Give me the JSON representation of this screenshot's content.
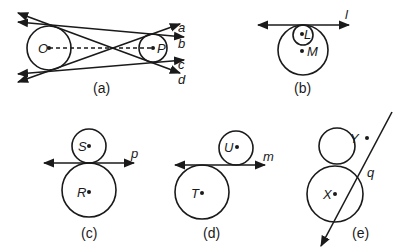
{
  "figures": {
    "a": {
      "caption": "(a)",
      "circles": [
        {
          "name": "O"
        },
        {
          "name": "P"
        }
      ],
      "lines": [
        "a",
        "b",
        "c",
        "d"
      ],
      "segment": "OP (dashed)"
    },
    "b": {
      "caption": "(b)",
      "circles": [
        {
          "name": "L"
        },
        {
          "name": "M"
        }
      ],
      "lines": [
        "l"
      ]
    },
    "c": {
      "caption": "(c)",
      "circles": [
        {
          "name": "S"
        },
        {
          "name": "R"
        }
      ],
      "lines": [
        "p"
      ]
    },
    "d": {
      "caption": "(d)",
      "circles": [
        {
          "name": "U"
        },
        {
          "name": "T"
        }
      ],
      "lines": [
        "m"
      ]
    },
    "e": {
      "caption": "(e)",
      "circles": [
        {
          "name": "Y"
        },
        {
          "name": "X"
        }
      ],
      "lines": [
        "q"
      ]
    }
  },
  "colors": {
    "ink": "#1a1a1a",
    "background": "#ffffff"
  }
}
